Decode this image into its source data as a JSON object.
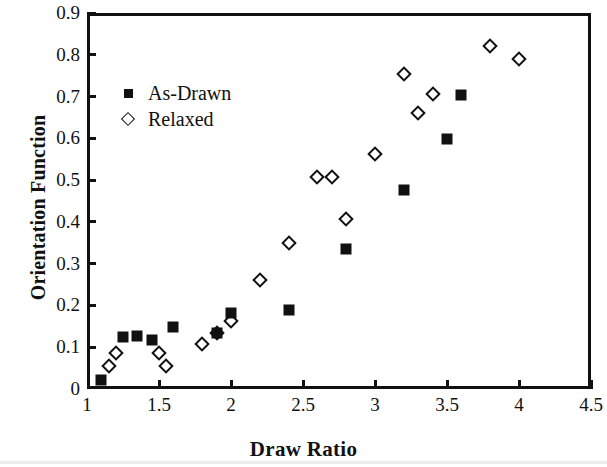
{
  "chart_data": {
    "type": "scatter",
    "title": "",
    "xlabel": "Draw Ratio",
    "ylabel": "Orientation Function",
    "xlim": [
      1,
      4.5
    ],
    "ylim": [
      0,
      0.9
    ],
    "xticks": [
      "1",
      "1.5",
      "2",
      "2.5",
      "3",
      "3.5",
      "4",
      "4.5"
    ],
    "xtick_values": [
      1,
      1.5,
      2,
      2.5,
      3,
      3.5,
      4,
      4.5
    ],
    "yticks": [
      "0",
      "0.1",
      "0.2",
      "0.3",
      "0.4",
      "0.5",
      "0.6",
      "0.7",
      "0.8",
      "0.9"
    ],
    "ytick_values": [
      0,
      0.1,
      0.2,
      0.3,
      0.4,
      0.5,
      0.6,
      0.7,
      0.8,
      0.9
    ],
    "grid": false,
    "legend_position": "upper-left-inside",
    "series": [
      {
        "name": "As-Drawn",
        "marker": "filled-square",
        "color": "#111111",
        "points": [
          [
            1.1,
            0.022
          ],
          [
            1.25,
            0.125
          ],
          [
            1.35,
            0.128
          ],
          [
            1.45,
            0.118
          ],
          [
            1.6,
            0.148
          ],
          [
            1.9,
            0.133
          ],
          [
            2.0,
            0.183
          ],
          [
            2.4,
            0.188
          ],
          [
            2.8,
            0.335
          ],
          [
            3.2,
            0.477
          ],
          [
            3.5,
            0.598
          ],
          [
            3.6,
            0.703
          ]
        ]
      },
      {
        "name": "Relaxed",
        "marker": "open-diamond",
        "color": "#111111",
        "points": [
          [
            1.15,
            0.055
          ],
          [
            1.2,
            0.085
          ],
          [
            1.5,
            0.085
          ],
          [
            1.55,
            0.055
          ],
          [
            1.8,
            0.108
          ],
          [
            1.9,
            0.135
          ],
          [
            2.0,
            0.163
          ],
          [
            2.2,
            0.26
          ],
          [
            2.4,
            0.35
          ],
          [
            2.6,
            0.508
          ],
          [
            2.7,
            0.508
          ],
          [
            2.8,
            0.408
          ],
          [
            3.0,
            0.563
          ],
          [
            3.2,
            0.753
          ],
          [
            3.3,
            0.66
          ],
          [
            3.4,
            0.705
          ],
          [
            3.8,
            0.82
          ],
          [
            4.0,
            0.79
          ]
        ]
      }
    ]
  },
  "legend": {
    "items": [
      {
        "label": "As-Drawn",
        "marker": "filled-square"
      },
      {
        "label": "Relaxed",
        "marker": "open-diamond"
      }
    ]
  },
  "axes": {
    "x_title": "Draw Ratio",
    "y_title": "Orientation Function"
  },
  "colors": {
    "ink": "#111111",
    "background": "#ffffff"
  }
}
